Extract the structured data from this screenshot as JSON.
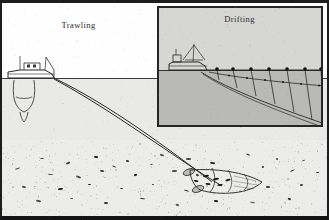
{
  "figure": {
    "width": 329,
    "height": 220,
    "border_color": "#1d1d1d"
  },
  "scenes": [
    {
      "id": "trawling",
      "label": "Trawling",
      "description": "Side view of a trawler towing a bottom trawl net along the seabed",
      "sky_color": "#fefefe",
      "water_color": "#e9e9e7",
      "seabed_color": "#ececeb",
      "waterline_y": 78,
      "seabed_y": 140,
      "vessel": {
        "name": "trawler",
        "x": 10,
        "y": 70
      },
      "gear": {
        "name": "bottom-trawl-net",
        "warp_count": 2,
        "cod_end_x": 250,
        "cod_end_y": 185
      }
    },
    {
      "id": "drifting",
      "label": "Drifting",
      "description": "Side view of a drifter vessel with a drift net suspended from surface floats",
      "sky_color": "#d6d6d4",
      "water_color": "#b9b9b7",
      "waterline_y": 62,
      "vessel": {
        "name": "drifter",
        "x": 20,
        "y": 54
      },
      "gear": {
        "name": "drift-net",
        "float_count": 8,
        "panel_count": 7
      }
    }
  ],
  "inset": {
    "label": "Drifting",
    "x": 157,
    "y": 6,
    "width": 166,
    "height": 121,
    "border_color": "#262626"
  },
  "colors": {
    "ink": "#2a2a2a",
    "frame": "#1d1d1d",
    "main_sky": "#fefefe",
    "main_water": "#e9e9e7",
    "main_seabed": "#ececeb",
    "inset_sky": "#d6d6d4",
    "inset_water": "#b9b9b7"
  }
}
